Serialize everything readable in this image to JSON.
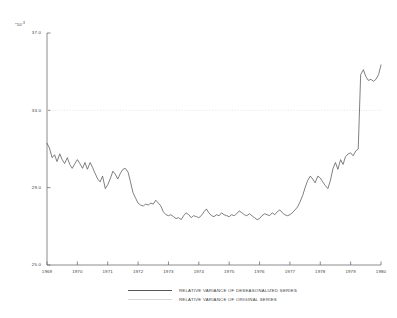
{
  "chart_data": {
    "type": "line",
    "title": "",
    "xlabel": "",
    "ylabel": "",
    "y_multiplier": "*10",
    "y_multiplier_exponent": "-3",
    "xlim": [
      1969.0,
      1980.0
    ],
    "ylim": [
      25.0,
      37.0
    ],
    "grid": false,
    "reference_line_y": 33.0,
    "yticks": [
      37.0,
      33.0,
      29.0,
      25.0
    ],
    "ytick_labels": [
      "37.0",
      "33.0",
      "29.0",
      "25.0"
    ],
    "xticks": [
      1969,
      1970,
      1971,
      1972,
      1973,
      1974,
      1975,
      1976,
      1977,
      1978,
      1979,
      1980
    ],
    "xtick_labels": [
      "1969",
      "1970",
      "1971",
      "1972",
      "1973",
      "1974",
      "1975",
      "1976",
      "1977",
      "1978",
      "1979",
      "1980"
    ],
    "legend_position": "below-axes",
    "series": [
      {
        "name": "RELATIVE VARIANCE OF DESEASONALIZED SERIES",
        "style": "solid",
        "color": "#555555",
        "x": [
          1969.0,
          1969.08,
          1969.17,
          1969.25,
          1969.33,
          1969.42,
          1969.5,
          1969.58,
          1969.67,
          1969.75,
          1969.83,
          1969.92,
          1970.0,
          1970.08,
          1970.17,
          1970.25,
          1970.33,
          1970.42,
          1970.5,
          1970.58,
          1970.67,
          1970.75,
          1970.83,
          1970.92,
          1971.0,
          1971.08,
          1971.17,
          1971.25,
          1971.33,
          1971.42,
          1971.5,
          1971.58,
          1971.67,
          1971.75,
          1971.83,
          1971.92,
          1972.0,
          1972.08,
          1972.17,
          1972.25,
          1972.33,
          1972.42,
          1972.5,
          1972.58,
          1972.67,
          1972.75,
          1972.83,
          1972.92,
          1973.0,
          1973.08,
          1973.17,
          1973.25,
          1973.33,
          1973.42,
          1973.5,
          1973.58,
          1973.67,
          1973.75,
          1973.83,
          1973.92,
          1974.0,
          1974.08,
          1974.17,
          1974.25,
          1974.33,
          1974.42,
          1974.5,
          1974.58,
          1974.67,
          1974.75,
          1974.83,
          1974.92,
          1975.0,
          1975.08,
          1975.17,
          1975.25,
          1975.33,
          1975.42,
          1975.5,
          1975.58,
          1975.67,
          1975.75,
          1975.83,
          1975.92,
          1976.0,
          1976.08,
          1976.17,
          1976.25,
          1976.33,
          1976.42,
          1976.5,
          1976.58,
          1976.67,
          1976.75,
          1976.83,
          1976.92,
          1977.0,
          1977.08,
          1977.17,
          1977.25,
          1977.33,
          1977.42,
          1977.5,
          1977.58,
          1977.67,
          1977.75,
          1977.83,
          1977.92,
          1978.0,
          1978.08,
          1978.17,
          1978.25,
          1978.33,
          1978.42,
          1978.5,
          1978.58,
          1978.67,
          1978.75,
          1978.83,
          1978.92,
          1979.0,
          1979.08,
          1979.17,
          1979.25,
          1979.33,
          1979.42,
          1979.5,
          1979.58,
          1979.67,
          1979.75,
          1979.83,
          1979.92,
          1980.0
        ],
        "values": [
          31.3,
          31.05,
          30.55,
          30.7,
          30.35,
          30.75,
          30.45,
          30.25,
          30.55,
          30.2,
          30.0,
          30.25,
          30.45,
          30.25,
          30.0,
          30.3,
          29.95,
          30.3,
          30.05,
          29.75,
          29.45,
          29.3,
          29.6,
          28.95,
          29.15,
          29.45,
          29.85,
          29.7,
          29.45,
          29.75,
          29.95,
          30.0,
          29.8,
          29.3,
          28.75,
          28.45,
          28.2,
          28.1,
          28.05,
          28.15,
          28.1,
          28.2,
          28.15,
          28.35,
          28.2,
          28.05,
          27.75,
          27.6,
          27.55,
          27.6,
          27.5,
          27.4,
          27.45,
          27.35,
          27.55,
          27.7,
          27.6,
          27.45,
          27.55,
          27.5,
          27.45,
          27.55,
          27.75,
          27.9,
          27.7,
          27.55,
          27.5,
          27.6,
          27.55,
          27.7,
          27.6,
          27.55,
          27.5,
          27.6,
          27.55,
          27.65,
          27.8,
          27.7,
          27.6,
          27.55,
          27.65,
          27.55,
          27.45,
          27.35,
          27.4,
          27.55,
          27.65,
          27.6,
          27.55,
          27.7,
          27.6,
          27.75,
          27.85,
          27.7,
          27.6,
          27.55,
          27.6,
          27.7,
          27.85,
          28.0,
          28.25,
          28.6,
          29.0,
          29.35,
          29.6,
          29.45,
          29.25,
          29.6,
          29.5,
          29.3,
          29.1,
          28.95,
          29.35,
          30.0,
          30.3,
          29.95,
          30.45,
          30.2,
          30.6,
          30.75,
          30.8,
          30.65,
          30.9,
          31.0,
          34.85,
          35.1,
          34.75,
          34.55,
          34.6,
          34.5,
          34.6,
          34.85,
          35.35
        ]
      },
      {
        "name": "RELATIVE VARIANCE OF ORIGINAL SERIES",
        "style": "dotted",
        "color": "#e2e2e2",
        "x": [
          1969.0,
          1980.0
        ],
        "values": [
          33.0,
          33.0
        ]
      }
    ]
  },
  "legend": {
    "entries": [
      {
        "label": "RELATIVE VARIANCE OF DESEASONALIZED SERIES",
        "style": "solid"
      },
      {
        "label": "RELATIVE VARIANCE OF ORIGINAL SERIES",
        "style": "faint"
      }
    ]
  }
}
